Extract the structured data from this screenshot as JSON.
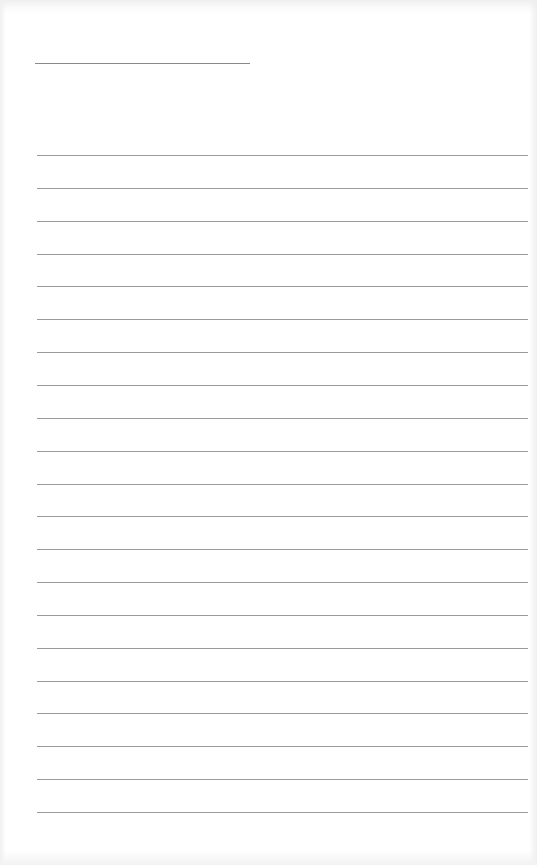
{
  "document": {
    "type": "lined-paper",
    "name_line": {
      "x1": 35,
      "x2": 250,
      "y": 63
    },
    "rules": {
      "count": 21,
      "start_y": 155,
      "spacing": 32.85,
      "x1": 37,
      "x2": 528
    },
    "colors": {
      "paper": "#ffffff",
      "rule": "#9a9a9a",
      "name_line": "#8a8a8a"
    }
  }
}
